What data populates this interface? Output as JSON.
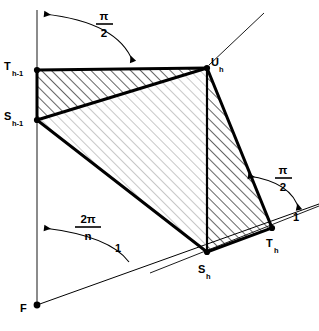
{
  "figure": {
    "kind": "geometry-diagram",
    "background_color": "#ffffff",
    "stroke_color": "#000000",
    "hatch_color": "#111111",
    "points": {
      "F": {
        "label": "F",
        "sub": "",
        "x": 37,
        "y": 305
      },
      "T_hm1": {
        "label": "T",
        "sub": "h-1",
        "x": 37,
        "y": 70
      },
      "S_hm1": {
        "label": "S",
        "sub": "h-1",
        "x": 37,
        "y": 120
      },
      "U_h": {
        "label": "U",
        "sub": "h",
        "x": 207,
        "y": 68
      },
      "S_h": {
        "label": "S",
        "sub": "h",
        "x": 207,
        "y": 252
      },
      "T_h": {
        "label": "T",
        "sub": "h",
        "x": 272,
        "y": 228
      }
    },
    "angles": [
      {
        "name": "top-right-angle",
        "numerator": "π",
        "denominator": "2",
        "x": 108,
        "y": 18
      },
      {
        "name": "right-right-angle",
        "numerator": "π",
        "denominator": "2",
        "x": 286,
        "y": 172
      },
      {
        "name": "central-angle",
        "numerator": "2π",
        "denominator": "n",
        "x": 88,
        "y": 221
      }
    ],
    "unit_marks": [
      {
        "name": "unit-length-right",
        "text": "1",
        "x": 296,
        "y": 217
      },
      {
        "name": "unit-length-bottom",
        "text": "1",
        "x": 119,
        "y": 247
      }
    ],
    "polygon_outline": "T_h-1 → U_h → T_h → S_h → S_h-1 → T_h-1",
    "internal_chords": [
      "S_h-1 → U_h",
      "U_h → S_h"
    ],
    "axis": {
      "name": "vertical-axis",
      "x": 37,
      "y_top": 10,
      "y_bottom": 305
    },
    "rays": [
      {
        "name": "ray-F-to-T_h",
        "from": "F",
        "to_x": 319,
        "to_y": 205
      },
      {
        "name": "ray-U_h-upright",
        "from": "U_h",
        "to_x": 264,
        "to_y": 13
      },
      {
        "name": "ray-S_h-through",
        "from_x": 150,
        "from_y": 272,
        "to_x": 319,
        "to_y": 207
      }
    ]
  }
}
